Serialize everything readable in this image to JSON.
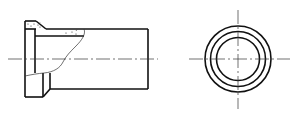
{
  "drawing": {
    "type": "technical-drawing",
    "subject": "flanged pipe sleeve",
    "views": [
      {
        "name": "front-view-partial-section",
        "features": [
          "flange",
          "chamfer",
          "pipe-body",
          "break-line",
          "section-hatching",
          "center-line"
        ]
      },
      {
        "name": "side-view",
        "features": [
          "outer-circle",
          "middle-circle",
          "inner-circle",
          "horizontal-center-line",
          "vertical-center-line"
        ]
      }
    ],
    "colors": {
      "line": "#111111",
      "background": "#ffffff"
    }
  }
}
